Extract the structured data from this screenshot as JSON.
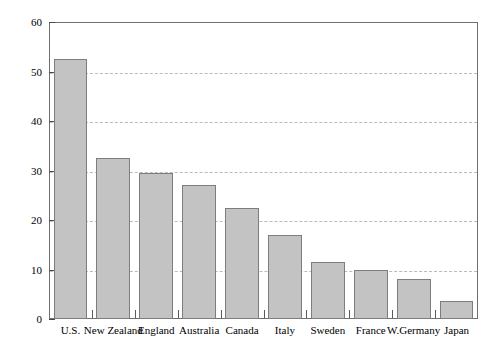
{
  "chart_data": {
    "type": "bar",
    "title": "",
    "subtitle": "",
    "xlabel": "",
    "ylabel": "Births per 1,000 Mothers Under 20",
    "categories": [
      "U.S.",
      "New Zealand",
      "England",
      "Australia",
      "Canada",
      "Italy",
      "Sweden",
      "France",
      "W.Germany",
      "Japan"
    ],
    "values": [
      52.6,
      32.5,
      29.4,
      27.0,
      22.5,
      17.0,
      11.6,
      10.0,
      8.0,
      3.7
    ],
    "ylim": [
      0,
      60
    ],
    "ytick_labels": [
      "0",
      "10",
      "20",
      "30",
      "40",
      "50",
      "60"
    ],
    "ytick_values": [
      0,
      10,
      20,
      30,
      40,
      50,
      60
    ],
    "grid": "horizontal-dashed",
    "gridline_values": [
      10,
      20,
      30,
      40,
      50
    ],
    "legend": "none",
    "legend_position": "none",
    "bar_fill_color": "#c3c3c3",
    "bar_border_color": "#7d7d7d",
    "gridline_color": "#b9b9c6",
    "frame_color": "#6f6f6f",
    "background_color": "#ffffff",
    "text_color": "#000000"
  }
}
